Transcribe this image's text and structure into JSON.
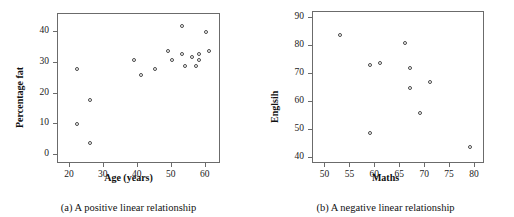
{
  "figure": {
    "panels": [
      {
        "id": "panel-a",
        "caption": "(a) A positive linear relationship",
        "chart": {
          "type": "scatter",
          "title": "",
          "xlabel": "Age (years)",
          "ylabel": "Percentage fat",
          "xlim": [
            16.5,
            64.5
          ],
          "ylim": [
            -3,
            46
          ],
          "xticks": [
            20,
            30,
            40,
            50,
            60
          ],
          "xticklabels": [
            "20",
            "30",
            "40",
            "50",
            "60"
          ],
          "yticks": [
            0,
            10,
            20,
            30,
            40
          ],
          "yticklabels": [
            "0",
            "10",
            "20",
            "30",
            "40"
          ],
          "grid": false,
          "legend": false,
          "marker": "open-circle",
          "marker_color": "#4a4a4a",
          "points": [
            {
              "x": 22,
              "y": 28
            },
            {
              "x": 22,
              "y": 10
            },
            {
              "x": 26,
              "y": 18
            },
            {
              "x": 26,
              "y": 4
            },
            {
              "x": 39,
              "y": 31
            },
            {
              "x": 41,
              "y": 26
            },
            {
              "x": 45,
              "y": 28
            },
            {
              "x": 49,
              "y": 34
            },
            {
              "x": 50,
              "y": 31
            },
            {
              "x": 53,
              "y": 42
            },
            {
              "x": 53,
              "y": 33
            },
            {
              "x": 54,
              "y": 29
            },
            {
              "x": 56,
              "y": 32
            },
            {
              "x": 57,
              "y": 29
            },
            {
              "x": 58,
              "y": 33
            },
            {
              "x": 58,
              "y": 31
            },
            {
              "x": 60,
              "y": 40
            },
            {
              "x": 61,
              "y": 34
            }
          ]
        }
      },
      {
        "id": "panel-b",
        "caption": "(b) A negative linear relationship",
        "chart": {
          "type": "scatter",
          "title": "",
          "xlabel": "Maths",
          "ylabel": "Englsih",
          "xlim": [
            47.5,
            82
          ],
          "ylim": [
            38,
            92
          ],
          "xticks": [
            50,
            55,
            60,
            65,
            70,
            75,
            80
          ],
          "xticklabels": [
            "50",
            "55",
            "60",
            "65",
            "70",
            "75",
            "80"
          ],
          "yticks": [
            40,
            50,
            60,
            70,
            80,
            90
          ],
          "yticklabels": [
            "40",
            "50",
            "60",
            "70",
            "80",
            "90"
          ],
          "grid": false,
          "legend": false,
          "marker": "open-circle",
          "marker_color": "#4a4a4a",
          "points": [
            {
              "x": 53,
              "y": 84
            },
            {
              "x": 59,
              "y": 73
            },
            {
              "x": 59,
              "y": 49
            },
            {
              "x": 61,
              "y": 74
            },
            {
              "x": 66,
              "y": 81
            },
            {
              "x": 67,
              "y": 72
            },
            {
              "x": 67,
              "y": 65
            },
            {
              "x": 69,
              "y": 56
            },
            {
              "x": 71,
              "y": 67
            },
            {
              "x": 79,
              "y": 44
            }
          ]
        }
      }
    ]
  },
  "chart_data": [
    {
      "type": "scatter",
      "title": "(a) A positive linear relationship",
      "xlabel": "Age (years)",
      "ylabel": "Percentage fat",
      "xlim": [
        16.5,
        64.5
      ],
      "ylim": [
        -3,
        46
      ],
      "xticks": [
        20,
        30,
        40,
        50,
        60
      ],
      "yticks": [
        0,
        10,
        20,
        30,
        40
      ],
      "grid": false,
      "legend": false,
      "x": [
        22,
        22,
        26,
        26,
        39,
        41,
        45,
        49,
        50,
        53,
        53,
        54,
        56,
        57,
        58,
        58,
        60,
        61
      ],
      "y": [
        28,
        10,
        18,
        4,
        31,
        26,
        28,
        34,
        31,
        42,
        33,
        29,
        32,
        29,
        33,
        31,
        40,
        34
      ]
    },
    {
      "type": "scatter",
      "title": "(b) A negative linear relationship",
      "xlabel": "Maths",
      "ylabel": "Englsih",
      "xlim": [
        47.5,
        82
      ],
      "ylim": [
        38,
        92
      ],
      "xticks": [
        50,
        55,
        60,
        65,
        70,
        75,
        80
      ],
      "yticks": [
        40,
        50,
        60,
        70,
        80,
        90
      ],
      "grid": false,
      "legend": false,
      "x": [
        53,
        59,
        59,
        61,
        66,
        67,
        67,
        69,
        71,
        79
      ],
      "y": [
        84,
        73,
        49,
        74,
        81,
        72,
        65,
        56,
        67,
        44
      ]
    }
  ]
}
